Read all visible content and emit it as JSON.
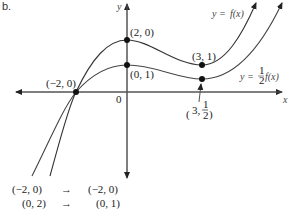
{
  "part_label": "b.",
  "axes": {
    "x_label": "x",
    "y_label": "y",
    "origin_label": "0"
  },
  "curves": [
    {
      "name": "f",
      "label_prefix": "y = ",
      "label_func": "f(x)"
    },
    {
      "name": "half_f",
      "label_prefix": "y = ",
      "label_frac_num": "1",
      "label_frac_den": "2",
      "label_func": "f(x)"
    }
  ],
  "points": {
    "shared": "(−2, 0)",
    "f_max": "(2, 0)",
    "half_max": "(0, 1)",
    "f_min": "(3, 1)",
    "half_min_prefix": "3,",
    "half_min_num": "1",
    "half_min_den": "2"
  },
  "mapping": [
    {
      "from": "(−2, 0)",
      "arrow": "→",
      "to": "(−2, 0)"
    },
    {
      "from": "(0, 2)",
      "arrow": "→",
      "to": "(0, 1)"
    }
  ]
}
